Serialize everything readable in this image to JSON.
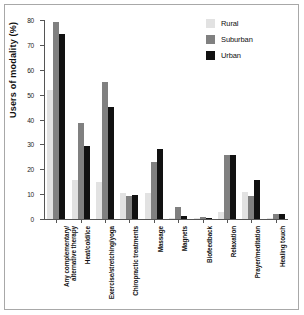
{
  "chart_data": {
    "type": "bar",
    "title": "",
    "xlabel": "",
    "ylabel": "Users of modality (%)",
    "ylim": [
      0,
      80
    ],
    "yticks": [
      0,
      10,
      20,
      30,
      40,
      50,
      60,
      70,
      80
    ],
    "grid": false,
    "legend_position": "top-right",
    "categories": [
      "Any complementary/\nalternative therapy",
      "Heat/cold/ice",
      "Exercise/stretching/yoga",
      "Chiropractic treatments",
      "Massage",
      "Magnets",
      "Biofeedback",
      "Relaxation",
      "Prayer/meditation",
      "Healing touch"
    ],
    "category_lines": [
      [
        "Any complementary/",
        "alternative therapy"
      ],
      [
        "Heat/cold/ice"
      ],
      [
        "Exercise/stretching/yoga"
      ],
      [
        "Chiropractic treatments"
      ],
      [
        "Massage"
      ],
      [
        "Magnets"
      ],
      [
        "Biofeedback"
      ],
      [
        "Relaxation"
      ],
      [
        "Prayer/meditation"
      ],
      [
        "Healing touch"
      ]
    ],
    "series": [
      {
        "name": "Rural",
        "color": "#e2e2e2",
        "values": [
          51.8,
          15.5,
          14.7,
          10.3,
          10.5,
          0.2,
          0.2,
          3.0,
          11.0,
          0.2
        ]
      },
      {
        "name": "Suburban",
        "color": "#808080",
        "values": [
          79.2,
          38.8,
          55.0,
          9.4,
          23.1,
          4.7,
          1.0,
          25.9,
          9.3,
          2.0
        ]
      },
      {
        "name": "Urban",
        "color": "#111111",
        "values": [
          74.5,
          29.5,
          45.2,
          9.5,
          28.2,
          1.3,
          0.4,
          25.9,
          15.7,
          2.0
        ]
      }
    ]
  },
  "legend": {
    "items": [
      {
        "label": "Rural",
        "color": "#e2e2e2"
      },
      {
        "label": "Suburban",
        "color": "#808080"
      },
      {
        "label": "Urban",
        "color": "#111111"
      }
    ]
  }
}
